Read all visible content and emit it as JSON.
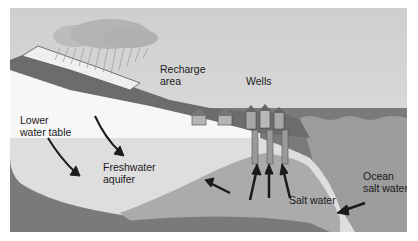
{
  "diagram": {
    "labels": {
      "recharge_line1": "Recharge",
      "recharge_line2": "area",
      "wells": "Wells",
      "lower_line1": "Lower",
      "lower_line2": "water table",
      "freshwater_line1": "Freshwater",
      "freshwater_line2": "aquifer",
      "salt_water": "Salt water",
      "ocean_line1": "Ocean",
      "ocean_line2": "salt water"
    },
    "elements": [
      "rain-cloud",
      "rain",
      "recharge-hillside",
      "houses",
      "wells",
      "freshwater-aquifer",
      "saltwater-wedge",
      "ocean",
      "flow-arrows"
    ],
    "colors": {
      "sky": "#d6d6d6",
      "cloud": "#bdbdbd",
      "ground_dark": "#6e6e6e",
      "ground_mid": "#8a8a8a",
      "aquifer": "#dcdcdc",
      "saltwater": "#a9a9a9",
      "ocean": "#9e9e9e",
      "bedrock": "#777777",
      "snow": "#f2f2f2"
    }
  }
}
